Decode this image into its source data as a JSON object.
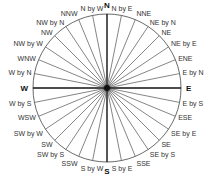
{
  "diagram": {
    "type": "compass-rose",
    "center": [
      107,
      88
    ],
    "radius": 74,
    "colors": {
      "line": "#333333",
      "cardinal_line": "#111111",
      "circle": "#444444",
      "background": "#ffffff"
    },
    "points": [
      {
        "label": "N",
        "deg": 0,
        "cardinal": true
      },
      {
        "label": "N by E",
        "deg": 11.25
      },
      {
        "label": "NNE",
        "deg": 22.5
      },
      {
        "label": "NE by N",
        "deg": 33.75
      },
      {
        "label": "NE",
        "deg": 45
      },
      {
        "label": "NE by E",
        "deg": 56.25
      },
      {
        "label": "ENE",
        "deg": 67.5
      },
      {
        "label": "E by N",
        "deg": 78.75
      },
      {
        "label": "E",
        "deg": 90,
        "cardinal": true
      },
      {
        "label": "E by S",
        "deg": 101.25
      },
      {
        "label": "ESE",
        "deg": 112.5
      },
      {
        "label": "SE by E",
        "deg": 123.75
      },
      {
        "label": "SE",
        "deg": 135
      },
      {
        "label": "SE by S",
        "deg": 146.25
      },
      {
        "label": "SSE",
        "deg": 157.5
      },
      {
        "label": "S by E",
        "deg": 168.75
      },
      {
        "label": "S",
        "deg": 180,
        "cardinal": true
      },
      {
        "label": "S by W",
        "deg": 191.25
      },
      {
        "label": "SSW",
        "deg": 202.5
      },
      {
        "label": "SW by S",
        "deg": 213.75
      },
      {
        "label": "SW",
        "deg": 225
      },
      {
        "label": "SW by W",
        "deg": 236.25
      },
      {
        "label": "WSW",
        "deg": 247.5
      },
      {
        "label": "W by S",
        "deg": 258.75
      },
      {
        "label": "W",
        "deg": 270,
        "cardinal": true
      },
      {
        "label": "W by N",
        "deg": 281.25
      },
      {
        "label": "WNW",
        "deg": 292.5
      },
      {
        "label": "NW by W",
        "deg": 303.75
      },
      {
        "label": "NW",
        "deg": 315
      },
      {
        "label": "NW by N",
        "deg": 326.25
      },
      {
        "label": "NNW",
        "deg": 337.5
      },
      {
        "label": "N by W",
        "deg": 348.75
      }
    ]
  }
}
